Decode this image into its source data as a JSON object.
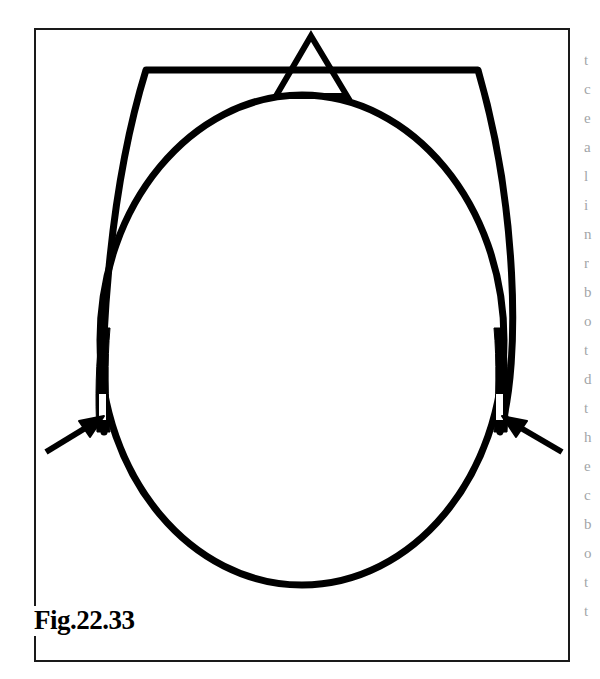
{
  "figure": {
    "caption": "Fig.22.33",
    "frame": {
      "x": 34,
      "y": 28,
      "width": 536,
      "height": 634,
      "stroke_color": "#1a1a1a",
      "stroke_width": 2,
      "fill": "#ffffff"
    },
    "ink_color": "#000000",
    "background_color": "#ffffff",
    "elements": [
      {
        "name": "outer-arch-outline",
        "type": "flat-topped-arch",
        "description": "Flat-topped arch / bonnet outline with straight horizontal top bar and curved sides descending to the side bands",
        "top_bar_y": 70,
        "top_left_corner_x": 146,
        "top_right_corner_x": 478,
        "bottom_left_x": 104,
        "bottom_right_x": 500,
        "bottom_y": 430,
        "stroke_width": 7
      },
      {
        "name": "inner-oval-outline",
        "type": "ellipse",
        "description": "Inner egg-shaped oval representing the head outline",
        "center_x": 302,
        "center_y": 340,
        "radius_x": 202,
        "radius_y": 245,
        "stroke_width": 7
      },
      {
        "name": "apex-triangle",
        "type": "triangle",
        "description": "Small open triangle sitting on top of the horizontal bar at the apex",
        "apex_x": 311,
        "apex_y": 36,
        "base_left_x": 276,
        "base_right_x": 347,
        "base_y": 96,
        "stroke_width": 6
      },
      {
        "name": "left-side-band",
        "type": "thick-vertical-band",
        "description": "Solid black thickened band where the outer arch and inner oval converge on the left, containing a small white slit",
        "x": 98,
        "y_top": 330,
        "y_bottom": 432,
        "slit": {
          "x": 99,
          "y": 394,
          "width": 7,
          "height": 26
        }
      },
      {
        "name": "right-side-band",
        "type": "thick-vertical-band",
        "description": "Solid black thickened band where the outer arch and inner oval converge on the right, containing a small white slit",
        "x": 498,
        "y_top": 330,
        "y_bottom": 432,
        "slit": {
          "x": 496,
          "y": 394,
          "width": 7,
          "height": 26
        }
      },
      {
        "name": "left-pointer-arrow",
        "type": "arrow",
        "description": "Arrow pointing up and to the right toward the white slit in the left side band",
        "tail_x": 46,
        "tail_y": 452,
        "tip_x": 104,
        "tip_y": 416,
        "stroke_width": 6
      },
      {
        "name": "right-pointer-arrow",
        "type": "arrow",
        "description": "Arrow pointing up and to the left toward the white slit in the right side band",
        "tail_x": 562,
        "tail_y": 452,
        "tip_x": 502,
        "tip_y": 416,
        "stroke_width": 6
      }
    ]
  },
  "column_bleed": {
    "description": "Clipped left edges of letters from the adjacent body-text column, cut off by the page crop",
    "fragments": [
      "t",
      "c",
      "e",
      "a",
      "l",
      "i",
      "n",
      "r",
      "b",
      "o",
      "t",
      "d",
      "t",
      "h",
      "e",
      "c",
      "b",
      "o",
      "t",
      "t"
    ]
  }
}
